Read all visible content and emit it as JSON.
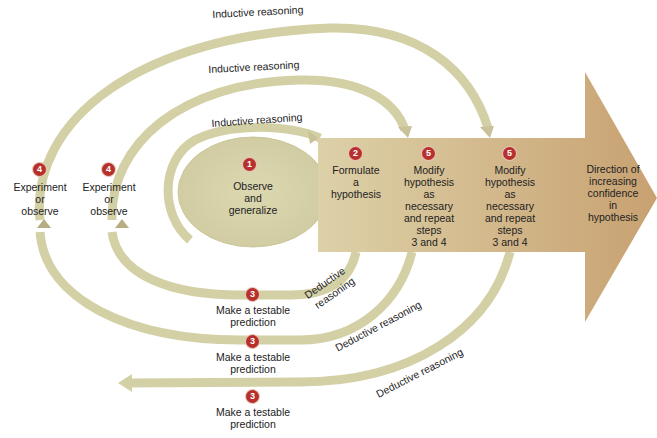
{
  "colors": {
    "loop": "#d4d0a6",
    "oval": "#d6d2a8",
    "arrow_start": "#ddd0a6",
    "arrow_end": "#c9a373",
    "badge": "#b8302c"
  },
  "steps": {
    "observe": {
      "num": "1",
      "text": [
        "Observe",
        "and",
        "generalize"
      ]
    },
    "formulate": {
      "num": "2",
      "text": [
        "Formulate",
        "a",
        "hypothesis"
      ]
    },
    "modify_1": {
      "num": "5",
      "text": [
        "Modify",
        "hypothesis",
        "as",
        "necessary",
        "and repeat",
        "steps",
        "3 and 4"
      ]
    },
    "modify_2": {
      "num": "5",
      "text": [
        "Modify",
        "hypothesis",
        "as",
        "necessary",
        "and repeat",
        "steps",
        "3 and 4"
      ]
    },
    "direction": {
      "text": [
        "Direction of",
        "increasing",
        "confidence",
        "in",
        "hypothesis"
      ]
    },
    "experiment_outer": {
      "num": "4",
      "text": [
        "Experiment",
        "or",
        "observe"
      ]
    },
    "experiment_inner": {
      "num": "4",
      "text": [
        "Experiment",
        "or",
        "observe"
      ]
    },
    "predict_1": {
      "num": "3",
      "text": [
        "Make a testable",
        "prediction"
      ]
    },
    "predict_2": {
      "num": "3",
      "text": [
        "Make a testable",
        "prediction"
      ]
    },
    "predict_3": {
      "num": "3",
      "text": [
        "Make a testable",
        "prediction"
      ]
    }
  },
  "reasoning": {
    "inductive_outer": "Inductive reasoning",
    "inductive_middle": "Inductive reasoning",
    "inductive_inner": "Inductive reasoning",
    "deductive_inner_1": "Deductive",
    "deductive_inner_2": "reasoning",
    "deductive_middle": "Deductive reasoning",
    "deductive_outer": "Deductive reasoning"
  }
}
